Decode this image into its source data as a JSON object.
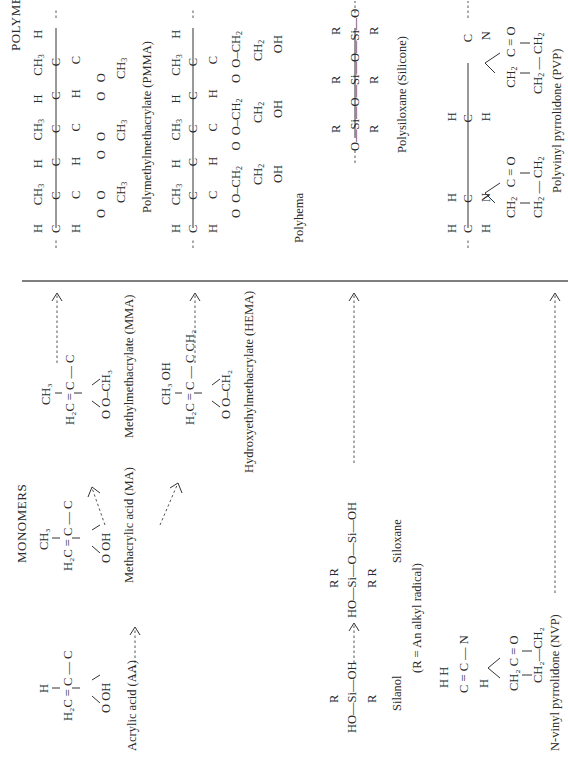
{
  "sections": {
    "monomers_title": "MONOMERS",
    "polymers_title": "POLYMERS"
  },
  "monomers": [
    {
      "id": "aa",
      "name": "Acrylic acid (AA)",
      "formula_lines": [
        "H",
        "H₂C = C — C",
        "O   OH"
      ]
    },
    {
      "id": "ma",
      "name": "Methacrylic acid (MA)",
      "formula_lines": [
        "CH₃",
        "H₂C = C — C",
        "O   OH"
      ]
    },
    {
      "id": "mma",
      "name": "Methylmethacrylate (MMA)",
      "formula_lines": [
        "CH₃",
        "H₂C = C — C",
        "O   O–CH₃"
      ]
    },
    {
      "id": "hema",
      "name": "Hydroxyethylmethacrylate (HEMA)",
      "formula_lines": [
        "CH₃   OH",
        "H₂C = C — C   CH₂",
        "O   O–CH₂"
      ]
    },
    {
      "id": "silanol",
      "name": "Silanol",
      "formula_lines": [
        "R",
        "HO—Si—OH",
        "R"
      ]
    },
    {
      "id": "siloxane",
      "name": "Siloxane",
      "formula_lines": [
        "R   R",
        "HO—Si—O—Si—OH",
        "R   R"
      ]
    },
    {
      "id": "nvp",
      "name": "N-vinyl pyrrolidone (NVP)",
      "formula_lines": [
        "H  H",
        "C = C — N",
        "H",
        "CH₂  C = O",
        "CH₂—CH₂"
      ]
    }
  ],
  "note": "(R = An alkyl radical)",
  "polymers": [
    {
      "id": "pmma",
      "name": "Polymethylmethacrylate (PMMA)"
    },
    {
      "id": "polyhema",
      "name": "Polyhema"
    },
    {
      "id": "silicone",
      "name": "Polysiloxane  (Silicone)"
    },
    {
      "id": "pvp",
      "name": "Polyvinyl pyrrolidone (PVP)"
    }
  ],
  "atoms": {
    "H": "H",
    "C": "C",
    "O": "O",
    "OH": "OH",
    "N": "N",
    "R": "R",
    "Si": "Si",
    "CH3": "CH₃",
    "CH2": "CH₂",
    "H2C": "H₂C",
    "HO": "HO",
    "CO": "C = O",
    "O_CH3": "O–CH₃",
    "O_CH2": "O–CH₂",
    "OCH2": "O–CH₂",
    "eq": "="
  },
  "colors": {
    "ink": "#2a2a2a",
    "line": "#555555",
    "background": "#ffffff"
  }
}
